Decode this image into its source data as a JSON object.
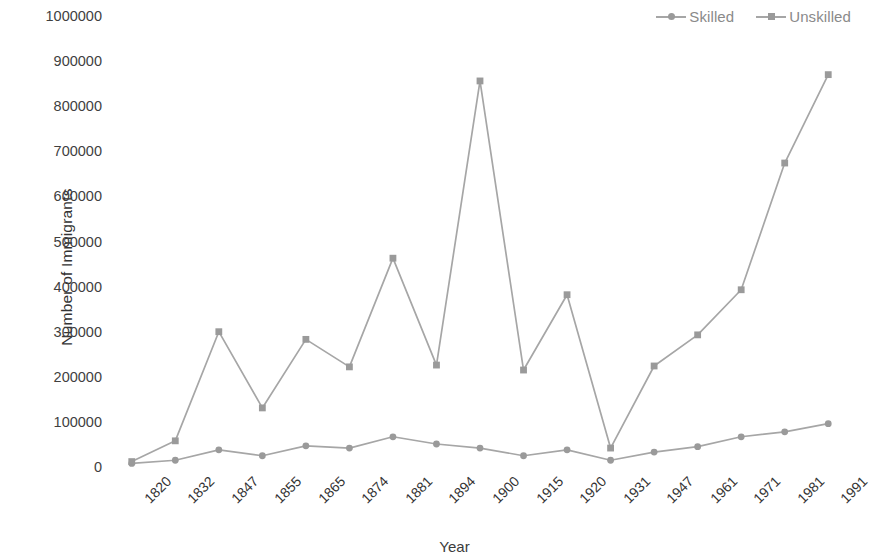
{
  "chart_data": {
    "type": "line",
    "title": "",
    "xlabel": "Year",
    "ylabel": "Number of Immigrants",
    "categories": [
      "1820",
      "1832",
      "1847",
      "1855",
      "1865",
      "1874",
      "1881",
      "1894",
      "1900",
      "1915",
      "1920",
      "1931",
      "1947",
      "1961",
      "1971",
      "1981",
      "1991"
    ],
    "ylim": [
      0,
      1000000
    ],
    "ytick_labels": [
      "1000000",
      "900000",
      "800000",
      "700000",
      "600000",
      "500000",
      "400000",
      "300000",
      "200000",
      "100000",
      "0"
    ],
    "ytick_values": [
      1000000,
      900000,
      800000,
      700000,
      600000,
      500000,
      400000,
      300000,
      200000,
      100000,
      0
    ],
    "grid": false,
    "legend_position": "top-right",
    "series": [
      {
        "name": "Skilled",
        "marker": "circle",
        "color": "#a6a6a6",
        "values": [
          8000,
          15000,
          38000,
          25000,
          47000,
          42000,
          67000,
          51000,
          42000,
          25000,
          38000,
          15000,
          33000,
          45000,
          67000,
          78000,
          96000
        ]
      },
      {
        "name": "Unskilled",
        "marker": "square",
        "color": "#a6a6a6",
        "values": [
          12000,
          58000,
          300000,
          131000,
          283000,
          222000,
          463000,
          226000,
          856000,
          215000,
          382000,
          42000,
          224000,
          293000,
          393000,
          674000,
          870000
        ]
      }
    ]
  },
  "legend": {
    "entries": [
      {
        "label": "Skilled",
        "marker": "circle"
      },
      {
        "label": "Unskilled",
        "marker": "square"
      }
    ]
  },
  "axes": {
    "y_title": "Number of Immigrants",
    "x_title": "Year"
  },
  "colors": {
    "line": "#a6a6a6",
    "marker": "#9a9a9a",
    "text": "#3f3f3f",
    "legend_text": "#8a8a8a",
    "background": "#ffffff"
  }
}
